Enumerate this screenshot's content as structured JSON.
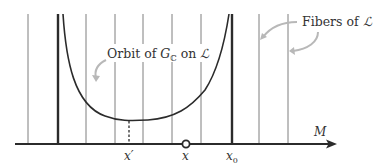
{
  "diagram": {
    "labels": {
      "orbit_prefix": "Orbit of ",
      "orbit_group": "G",
      "orbit_group_sub": "ℂ",
      "orbit_suffix": " on ",
      "orbit_space": "ℒ",
      "fibers_prefix": "Fibers of ",
      "fibers_space": "ℒ",
      "axis_name": "M",
      "point_x_prime": "x′",
      "point_x": "x",
      "point_x0_base": "x",
      "point_x0_sub": "0"
    },
    "colors": {
      "line": "#2b2b2b",
      "fiber": "#6b6b6b",
      "arrow_annotation": "#b5b5b5",
      "text": "#333333"
    },
    "fiber_x_positions": [
      28,
      86,
      115,
      143,
      172,
      259,
      288
    ],
    "thick_lines_x": [
      58,
      232
    ],
    "axis": {
      "y": 144,
      "x_start": 15,
      "x_end": 336
    }
  }
}
